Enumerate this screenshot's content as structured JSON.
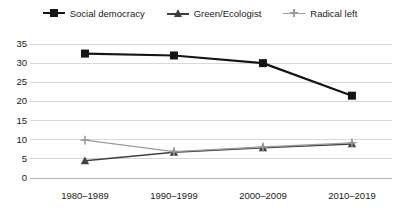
{
  "chart_data": {
    "type": "line",
    "title": "",
    "subtitle": "",
    "xlabel": "",
    "ylabel": "",
    "categories": [
      "1980–1989",
      "1990–1999",
      "2000–2009",
      "2010–2019"
    ],
    "ylim": [
      0,
      35
    ],
    "y_ticks": [
      0,
      5,
      10,
      15,
      20,
      25,
      30,
      35
    ],
    "y_tick_labels": [
      "0",
      "5",
      "10",
      "15",
      "20",
      "25",
      "30",
      "35"
    ],
    "grid": "horizontal",
    "legend_position": "top-center",
    "series": [
      {
        "name": "Social democracy",
        "values": [
          32.5,
          32.0,
          30.0,
          21.5
        ],
        "color": "#151515",
        "marker": "square",
        "line_width": 2.2
      },
      {
        "name": "Green/Ecologist",
        "values": [
          4.5,
          6.7,
          7.9,
          8.9
        ],
        "color": "#3f3f3f",
        "marker": "triangle",
        "line_width": 1.5
      },
      {
        "name": "Radical left",
        "values": [
          9.9,
          6.9,
          8.1,
          9.2
        ],
        "color": "#9b9b9b",
        "marker": "plus",
        "line_width": 1.3
      }
    ]
  },
  "legend": {
    "items": [
      {
        "label": "Social democracy",
        "marker": "square-marker"
      },
      {
        "label": "Green/Ecologist",
        "marker": "triangle-marker"
      },
      {
        "label": "Radical left",
        "marker": "plus-marker"
      }
    ]
  },
  "axes": {
    "y_tick_labels": [
      "35",
      "30",
      "25",
      "20",
      "15",
      "10",
      "5",
      "0"
    ],
    "x_tick_labels": [
      "1980–1989",
      "1990–1999",
      "2000–2009",
      "2010–2019"
    ]
  },
  "colors": {
    "series_1": "#151515",
    "series_2": "#3f3f3f",
    "series_3": "#9b9b9b",
    "gridline": "#d8d8d8",
    "axis": "#b4b4b4",
    "text": "#1a1a1a",
    "background": "#ffffff"
  }
}
